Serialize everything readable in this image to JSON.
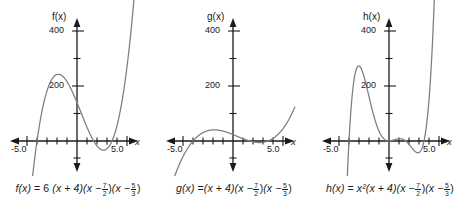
{
  "figure": {
    "background": "#ffffff",
    "curve_color": "#7d7d7d",
    "axis_color": "#1a1a1a",
    "text_color": "#1a1a1a"
  },
  "panels": [
    {
      "title": "f(x)",
      "x_axis_label": "x",
      "x_tick_labels": [
        "-5.0",
        "5.0"
      ],
      "y_tick_labels": [
        "200",
        "400"
      ],
      "equation": {
        "lhs": "f(x)",
        "equals": "=",
        "coefficient": "6",
        "factor1": "(x + 4)",
        "factor2_open": "(x −",
        "factor2_num": "7",
        "factor2_den": "2",
        "factor2_close": ")",
        "factor3_open": "(x −",
        "factor3_num": "5",
        "factor3_den": "3",
        "factor3_close": ")",
        "plain": "f(x) = 6 (x + 4)(x − 7/2)(x − 5/3)"
      }
    },
    {
      "title": "g(x)",
      "x_axis_label": "x",
      "x_tick_labels": [
        "-5.0",
        "5.0"
      ],
      "y_tick_labels": [
        "200",
        "400"
      ],
      "equation": {
        "lhs": "g(x)",
        "equals": "=",
        "coefficient": "",
        "factor1": "(x + 4)",
        "factor2_open": "(x −",
        "factor2_num": "7",
        "factor2_den": "2",
        "factor2_close": ")",
        "factor3_open": "(x −",
        "factor3_num": "5",
        "factor3_den": "3",
        "factor3_close": ")",
        "plain": "g(x) = (x + 4)(x − 7/2)(x − 5/3)"
      }
    },
    {
      "title": "h(x)",
      "x_axis_label": "x",
      "x_tick_labels": [
        "-5.0",
        "5.0"
      ],
      "y_tick_labels": [
        "200",
        "400"
      ],
      "equation": {
        "lhs": "h(x)",
        "equals": "=",
        "coefficient": "x²",
        "factor1": "(x + 4)",
        "factor2_open": "(x −",
        "factor2_num": "7",
        "factor2_den": "2",
        "factor2_close": ")",
        "factor3_open": "(x −",
        "factor3_num": "5",
        "factor3_den": "3",
        "factor3_close": ")",
        "plain": "h(x) = x²(x + 4)(x − 7/2)(x − 5/3)"
      }
    }
  ],
  "chart_data": [
    {
      "type": "line",
      "title": "f(x)",
      "xlabel": "x",
      "ylabel": "f(x)",
      "xlim": [
        -6.2,
        6.2
      ],
      "ylim": [
        -260,
        520
      ],
      "xticks": [
        -5,
        -4,
        -3,
        -2,
        -1,
        1,
        2,
        3,
        4,
        5
      ],
      "xtick_labels": {
        "-5": "-5.0",
        "5": "5.0"
      },
      "yticks": [
        100,
        200,
        300,
        400
      ],
      "ytick_labels": {
        "200": "200",
        "400": "400"
      },
      "grid": false,
      "legend": "none",
      "expression": "6(x + 4)(x - 3.5)(x - 1.6667)",
      "roots": [
        -4,
        1.6667,
        3.5
      ],
      "series": [
        {
          "name": "f",
          "x": [
            -5.0,
            -4.5,
            -4.0,
            -3.5,
            -3.0,
            -2.5,
            -2.0,
            -1.5,
            -1.0,
            -0.5,
            0.0,
            0.5,
            1.0,
            1.5,
            2.0,
            2.5,
            3.0,
            3.5,
            4.0,
            4.5,
            5.0
          ],
          "y": [
            -510,
            -228,
            0,
            169,
            281,
            341,
            354,
            325,
            259,
            161,
            35,
            -113,
            -280,
            -461,
            -652,
            -848,
            -1045,
            0,
            800,
            2000,
            3600
          ]
        }
      ]
    },
    {
      "type": "line",
      "title": "g(x)",
      "xlabel": "x",
      "ylabel": "g(x)",
      "xlim": [
        -6.2,
        6.2
      ],
      "ylim": [
        -260,
        520
      ],
      "xticks": [
        -5,
        -4,
        -3,
        -2,
        -1,
        1,
        2,
        3,
        4,
        5
      ],
      "xtick_labels": {
        "-5": "-5.0",
        "5": "5.0"
      },
      "yticks": [
        100,
        200,
        300,
        400
      ],
      "ytick_labels": {
        "200": "200",
        "400": "400"
      },
      "grid": false,
      "legend": "none",
      "expression": "(x + 4)(x - 3.5)(x - 1.6667)",
      "roots": [
        -4,
        1.6667,
        3.5
      ],
      "series": [
        {
          "name": "g",
          "x": [
            -5.0,
            -4.5,
            -4.0,
            -3.5,
            -3.0,
            -2.5,
            -2.0,
            -1.5,
            -1.0,
            -0.5,
            0.0,
            0.5,
            1.0,
            1.5,
            2.0,
            2.5,
            3.0,
            3.5,
            4.0,
            4.5,
            5.0
          ],
          "y": [
            -85,
            -38,
            0,
            28,
            47,
            57,
            59,
            54,
            43,
            27,
            6,
            -19,
            -47,
            -77,
            -109,
            -141,
            -174,
            0,
            133,
            318,
            600
          ]
        }
      ]
    },
    {
      "type": "line",
      "title": "h(x)",
      "xlabel": "x",
      "ylabel": "h(x)",
      "xlim": [
        -6.2,
        6.2
      ],
      "ylim": [
        -260,
        520
      ],
      "xticks": [
        -5,
        -4,
        -3,
        -2,
        -1,
        1,
        2,
        3,
        4,
        5
      ],
      "xtick_labels": {
        "-5": "-5.0",
        "5": "5.0"
      },
      "yticks": [
        100,
        200,
        300,
        400
      ],
      "ytick_labels": {
        "200": "200",
        "400": "400"
      },
      "grid": false,
      "legend": "none",
      "expression": "x^2 (x + 4)(x - 3.5)(x - 1.6667)",
      "roots": [
        -4,
        0,
        0,
        1.6667,
        3.5
      ],
      "series": [
        {
          "name": "h",
          "x": [
            -5.0,
            -4.5,
            -4.0,
            -3.5,
            -3.0,
            -2.5,
            -2.0,
            -1.5,
            -1.0,
            -0.5,
            0.0,
            0.5,
            1.0,
            1.5,
            2.0,
            2.5,
            3.0,
            3.5,
            4.0,
            4.5,
            5.0
          ],
          "y": [
            -2125,
            -770,
            0,
            343,
            420,
            356,
            236,
            121,
            43,
            7,
            0,
            -5,
            -47,
            -173,
            -436,
            -881,
            -1563,
            0,
            2133,
            6440,
            15000
          ]
        }
      ]
    }
  ]
}
